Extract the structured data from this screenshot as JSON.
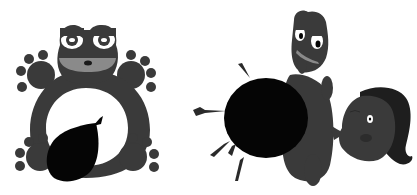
{
  "scene": {
    "description": "Two-panel grayscale cartoon illustration",
    "colors": {
      "background": "#ffffff",
      "body": "#3a3a3a",
      "dark": "#050505",
      "mid": "#8a8a8a",
      "eye_white": "#ffffff"
    },
    "panels": [
      {
        "id": "left",
        "caption": "Frog holding a black balloon",
        "characters": [
          "frog"
        ],
        "objects": [
          "balloon"
        ]
      },
      {
        "id": "right",
        "caption": "Creature pressed against a woman's face with a black balloon and motion lines",
        "characters": [
          "creature",
          "woman"
        ],
        "objects": [
          "balloon",
          "motion-lines"
        ]
      }
    ]
  }
}
